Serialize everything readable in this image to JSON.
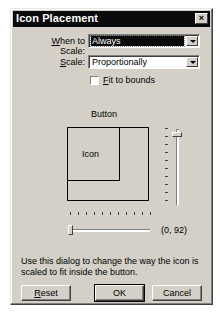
{
  "window": {
    "title": "Icon Placement",
    "close_icon": "close-x-icon",
    "close_glyph": "×"
  },
  "form": {
    "when_to_scale": {
      "label_accel": "W",
      "label_rest": "hen to Scale:",
      "value": "Always"
    },
    "scale": {
      "label_accel": "S",
      "label_rest": "cale:",
      "value": "Proportionally"
    },
    "fit_to_bounds": {
      "label_accel": "F",
      "label_rest": "it to bounds",
      "checked": false
    }
  },
  "preview": {
    "button_label": "Button",
    "icon_label": "Icon",
    "position_readout": "(0, 92)",
    "horizontal_slider_value": 0,
    "vertical_slider_value": 92
  },
  "description": "Use this dialog to change the way the icon is scaled to fit inside the button.",
  "buttons": {
    "reset_accel": "R",
    "reset_rest": "eset",
    "ok": "OK",
    "cancel": "Cancel"
  },
  "colors": {
    "face": "#d4d0c8",
    "titlebar": "#0a0a0a",
    "selection": "#0a0a0a"
  }
}
